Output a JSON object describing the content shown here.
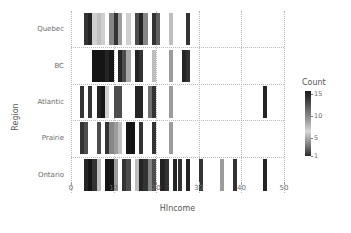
{
  "chart_data": {
    "type": "heatmap",
    "title": "",
    "xlabel": "HIncome",
    "ylabel": "Region",
    "xlim": [
      0,
      50
    ],
    "xticks": [
      0,
      10,
      20,
      30,
      40,
      50
    ],
    "grid": true,
    "rows": [
      "Quebec",
      "BC",
      "Atlantic",
      "Prairie",
      "Ontario"
    ],
    "row_order_top_to_bottom": [
      "Quebec",
      "BC",
      "Atlantic",
      "Prairie",
      "Ontario"
    ],
    "legend": {
      "title": "Count",
      "position": "right",
      "ticks": [
        15,
        10,
        5,
        1
      ],
      "scale": "grayscale",
      "low_color": "#2b2b2b",
      "mid_color": "#d8d8d8",
      "high_color": "#1a1a1a"
    },
    "cells": [
      {
        "row": "Quebec",
        "x": 3,
        "count": 13
      },
      {
        "row": "Quebec",
        "x": 4,
        "count": 14
      },
      {
        "row": "Quebec",
        "x": 5,
        "count": 6
      },
      {
        "row": "Quebec",
        "x": 6,
        "count": 7
      },
      {
        "row": "Quebec",
        "x": 7,
        "count": 6
      },
      {
        "row": "Quebec",
        "x": 9,
        "count": 9
      },
      {
        "row": "Quebec",
        "x": 10,
        "count": 13
      },
      {
        "row": "Quebec",
        "x": 11,
        "count": 8
      },
      {
        "row": "Quebec",
        "x": 13,
        "count": 6
      },
      {
        "row": "Quebec",
        "x": 15,
        "count": 12
      },
      {
        "row": "Quebec",
        "x": 16,
        "count": 14
      },
      {
        "row": "Quebec",
        "x": 17,
        "count": 9
      },
      {
        "row": "Quebec",
        "x": 19,
        "count": 13
      },
      {
        "row": "Quebec",
        "x": 20,
        "count": 11
      },
      {
        "row": "Quebec",
        "x": 23,
        "count": 7
      },
      {
        "row": "Quebec",
        "x": 27,
        "count": 13
      },
      {
        "row": "BC",
        "x": 5,
        "count": 15
      },
      {
        "row": "BC",
        "x": 6,
        "count": 15
      },
      {
        "row": "BC",
        "x": 7,
        "count": 15
      },
      {
        "row": "BC",
        "x": 8,
        "count": 14
      },
      {
        "row": "BC",
        "x": 9,
        "count": 15
      },
      {
        "row": "BC",
        "x": 11,
        "count": 14
      },
      {
        "row": "BC",
        "x": 12,
        "count": 12
      },
      {
        "row": "BC",
        "x": 13,
        "count": 5
      },
      {
        "row": "BC",
        "x": 15,
        "count": 14
      },
      {
        "row": "BC",
        "x": 16,
        "count": 13
      },
      {
        "row": "BC",
        "x": 19,
        "count": 7
      },
      {
        "row": "BC",
        "x": 23,
        "count": 8
      },
      {
        "row": "BC",
        "x": 26,
        "count": 14
      },
      {
        "row": "BC",
        "x": 27,
        "count": 13
      },
      {
        "row": "Atlantic",
        "x": 2,
        "count": 13
      },
      {
        "row": "Atlantic",
        "x": 4,
        "count": 13
      },
      {
        "row": "Atlantic",
        "x": 6,
        "count": 14
      },
      {
        "row": "Atlantic",
        "x": 7,
        "count": 15
      },
      {
        "row": "Atlantic",
        "x": 8,
        "count": 6
      },
      {
        "row": "Atlantic",
        "x": 10,
        "count": 12
      },
      {
        "row": "Atlantic",
        "x": 11,
        "count": 12
      },
      {
        "row": "Atlantic",
        "x": 15,
        "count": 14
      },
      {
        "row": "Atlantic",
        "x": 16,
        "count": 14
      },
      {
        "row": "Atlantic",
        "x": 18,
        "count": 10
      },
      {
        "row": "Atlantic",
        "x": 19,
        "count": 13
      },
      {
        "row": "Atlantic",
        "x": 23,
        "count": 8
      },
      {
        "row": "Atlantic",
        "x": 45,
        "count": 14
      },
      {
        "row": "Prairie",
        "x": 2,
        "count": 13
      },
      {
        "row": "Prairie",
        "x": 3,
        "count": 12
      },
      {
        "row": "Prairie",
        "x": 6,
        "count": 12
      },
      {
        "row": "Prairie",
        "x": 8,
        "count": 13
      },
      {
        "row": "Prairie",
        "x": 9,
        "count": 9
      },
      {
        "row": "Prairie",
        "x": 10,
        "count": 8
      },
      {
        "row": "Prairie",
        "x": 11,
        "count": 7
      },
      {
        "row": "Prairie",
        "x": 13,
        "count": 15
      },
      {
        "row": "Prairie",
        "x": 14,
        "count": 15
      },
      {
        "row": "Prairie",
        "x": 16,
        "count": 13
      },
      {
        "row": "Prairie",
        "x": 19,
        "count": 13
      },
      {
        "row": "Prairie",
        "x": 23,
        "count": 8
      },
      {
        "row": "Ontario",
        "x": 3,
        "count": 14
      },
      {
        "row": "Ontario",
        "x": 4,
        "count": 15
      },
      {
        "row": "Ontario",
        "x": 5,
        "count": 13
      },
      {
        "row": "Ontario",
        "x": 6,
        "count": 7
      },
      {
        "row": "Ontario",
        "x": 8,
        "count": 15
      },
      {
        "row": "Ontario",
        "x": 9,
        "count": 15
      },
      {
        "row": "Ontario",
        "x": 10,
        "count": 8
      },
      {
        "row": "Ontario",
        "x": 12,
        "count": 13
      },
      {
        "row": "Ontario",
        "x": 13,
        "count": 12
      },
      {
        "row": "Ontario",
        "x": 15,
        "count": 7
      },
      {
        "row": "Ontario",
        "x": 16,
        "count": 14
      },
      {
        "row": "Ontario",
        "x": 17,
        "count": 13
      },
      {
        "row": "Ontario",
        "x": 18,
        "count": 9
      },
      {
        "row": "Ontario",
        "x": 19,
        "count": 12
      },
      {
        "row": "Ontario",
        "x": 21,
        "count": 14
      },
      {
        "row": "Ontario",
        "x": 22,
        "count": 13
      },
      {
        "row": "Ontario",
        "x": 24,
        "count": 14
      },
      {
        "row": "Ontario",
        "x": 25,
        "count": 13
      },
      {
        "row": "Ontario",
        "x": 27,
        "count": 14
      },
      {
        "row": "Ontario",
        "x": 30,
        "count": 13
      },
      {
        "row": "Ontario",
        "x": 35,
        "count": 8
      },
      {
        "row": "Ontario",
        "x": 38,
        "count": 13
      },
      {
        "row": "Ontario",
        "x": 45,
        "count": 14
      }
    ]
  }
}
